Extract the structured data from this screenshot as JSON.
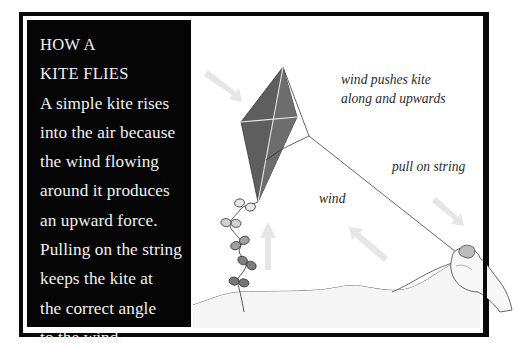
{
  "panel": {
    "title_lines": [
      "HOW A",
      "KITE FLIES"
    ],
    "body_lines": [
      "A simple kite rises",
      "into the air because",
      "the wind flowing",
      "around it produces",
      "an upward force.",
      "Pulling on the string",
      "keeps the kite at",
      "the correct angle",
      "to the wind."
    ]
  },
  "diagram": {
    "labels": {
      "wind_pushes_line1": "wind pushes kite",
      "wind_pushes_line2": "along and upwards",
      "pull_on_string": "pull on string",
      "wind": "wind"
    },
    "colors": {
      "frame": "#0a0a0a",
      "panel_bg": "#050505",
      "panel_text": "#f2f2f2",
      "kite_fill": "#5e5e5e",
      "kite_spars": "#e8e8e8",
      "string": "#555555",
      "bow_fill_light": "#d8d8d8",
      "bow_fill_dark": "#7a7a7a",
      "wind_arrows": "#e4e4e4"
    },
    "icons": [
      "kite-icon",
      "tail-bow-icon",
      "hand-icon",
      "wind-arrow-icon",
      "hill-outline"
    ]
  }
}
